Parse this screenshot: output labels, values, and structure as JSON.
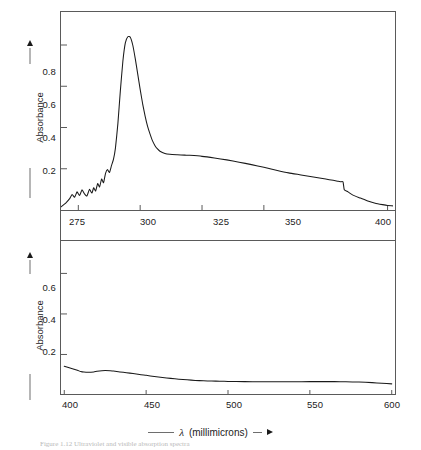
{
  "figure": {
    "xlabel_prefix": "——",
    "xlabel_symbol": "λ",
    "xlabel_text": "(millimicrons)",
    "caption": "Figure 1.12 Ultraviolet and visible absorption spectra",
    "ylabel": "Absorbance",
    "line_color": "#1a1a1a",
    "frame_color": "#5a5a5a"
  },
  "chart_data": [
    {
      "type": "line",
      "panel": "top",
      "title": "",
      "xlabel": "λ (millimicrons)",
      "ylabel": "Absorbance",
      "xlim": [
        268,
        403
      ],
      "ylim": [
        0,
        0.96
      ],
      "xticks": [
        275,
        300,
        325,
        350,
        400
      ],
      "xticklabels": [
        "275",
        "300",
        "325",
        "350",
        "400"
      ],
      "yticks": [
        0.2,
        0.4,
        0.6,
        0.8
      ],
      "yticklabels": [
        "0.2",
        "0.4",
        "0.6",
        "0.8"
      ],
      "grid": false,
      "legend": "none",
      "peak": {
        "x": 292,
        "y": 0.84
      },
      "plateau": {
        "x_range": [
          310,
          330
        ],
        "y": 0.27
      },
      "step_drop": {
        "x": 382,
        "y_before": 0.135,
        "y_after": 0.085
      },
      "x": [
        268,
        270,
        271.5,
        272.5,
        273.5,
        274.5,
        275.5,
        276.5,
        277.5,
        278.5,
        279.5,
        280.5,
        281.2,
        282,
        282.8,
        283.6,
        284.4,
        285.2,
        286,
        286.8,
        287.6,
        288.4,
        289.2,
        290,
        291,
        292,
        293,
        294,
        295,
        296,
        297,
        298,
        299,
        300,
        301,
        302,
        303,
        304,
        305,
        306,
        307,
        308,
        310,
        312,
        315,
        318,
        320,
        325,
        330,
        335,
        340,
        345,
        350,
        355,
        360,
        365,
        370,
        375,
        378,
        380,
        381,
        382,
        382.5,
        384,
        386,
        389,
        392,
        395,
        398,
        400,
        402
      ],
      "y": [
        0.015,
        0.035,
        0.055,
        0.075,
        0.062,
        0.088,
        0.07,
        0.098,
        0.078,
        0.068,
        0.1,
        0.082,
        0.108,
        0.092,
        0.128,
        0.112,
        0.15,
        0.132,
        0.178,
        0.196,
        0.182,
        0.215,
        0.245,
        0.3,
        0.42,
        0.58,
        0.72,
        0.81,
        0.84,
        0.838,
        0.8,
        0.735,
        0.66,
        0.585,
        0.515,
        0.455,
        0.405,
        0.368,
        0.335,
        0.312,
        0.296,
        0.285,
        0.274,
        0.27,
        0.268,
        0.266,
        0.265,
        0.26,
        0.252,
        0.243,
        0.232,
        0.22,
        0.207,
        0.193,
        0.18,
        0.17,
        0.16,
        0.15,
        0.144,
        0.139,
        0.137,
        0.136,
        0.098,
        0.088,
        0.072,
        0.058,
        0.044,
        0.033,
        0.026,
        0.022,
        0.02,
        0.018
      ]
    },
    {
      "type": "line",
      "panel": "bottom",
      "title": "",
      "xlabel": "λ (millimicrons)",
      "ylabel": "Absorbance",
      "xlim": [
        398,
        602
      ],
      "ylim": [
        0,
        0.76
      ],
      "xticks": [
        400,
        450,
        500,
        550,
        600
      ],
      "xticklabels": [
        "400",
        "450",
        "500",
        "550",
        "600"
      ],
      "yticks": [
        0.2,
        0.4,
        0.6
      ],
      "yticklabels": [
        "0.2",
        "0.4",
        "0.6"
      ],
      "grid": false,
      "legend": "none",
      "x": [
        400,
        404,
        408,
        410,
        412,
        415,
        418,
        420,
        423,
        425,
        428,
        430,
        434,
        438,
        442,
        446,
        450,
        455,
        460,
        465,
        470,
        475,
        480,
        485,
        490,
        495,
        500,
        510,
        520,
        530,
        540,
        550,
        558,
        565,
        572,
        580,
        588,
        594,
        600
      ],
      "y": [
        0.142,
        0.132,
        0.122,
        0.116,
        0.113,
        0.112,
        0.114,
        0.117,
        0.12,
        0.121,
        0.12,
        0.118,
        0.114,
        0.11,
        0.106,
        0.101,
        0.097,
        0.091,
        0.086,
        0.082,
        0.078,
        0.075,
        0.072,
        0.07,
        0.069,
        0.068,
        0.067,
        0.066,
        0.065,
        0.065,
        0.065,
        0.066,
        0.066,
        0.066,
        0.065,
        0.064,
        0.061,
        0.058,
        0.055
      ]
    }
  ],
  "axes": {
    "top": {
      "ytick_labels": [
        {
          "value": "0.8",
          "top": 72
        },
        {
          "value": "0.6",
          "top": 105
        },
        {
          "value": "0.4",
          "top": 138
        },
        {
          "value": "0.2",
          "top": 171
        }
      ],
      "xtick_labels": [
        {
          "value": "275",
          "left": 77
        },
        {
          "value": "300",
          "left": 148
        },
        {
          "value": "325",
          "left": 221
        },
        {
          "value": "350",
          "left": 293
        },
        {
          "value": "400",
          "left": 383
        }
      ]
    },
    "bottom": {
      "ytick_labels": [
        {
          "value": "0.6",
          "top": 288
        },
        {
          "value": "0.4",
          "top": 320
        },
        {
          "value": "0.2",
          "top": 352
        }
      ],
      "xtick_labels": [
        {
          "value": "400",
          "left": 70
        },
        {
          "value": "450",
          "left": 152
        },
        {
          "value": "500",
          "left": 234
        },
        {
          "value": "550",
          "left": 315
        },
        {
          "value": "600",
          "left": 392
        }
      ]
    }
  }
}
